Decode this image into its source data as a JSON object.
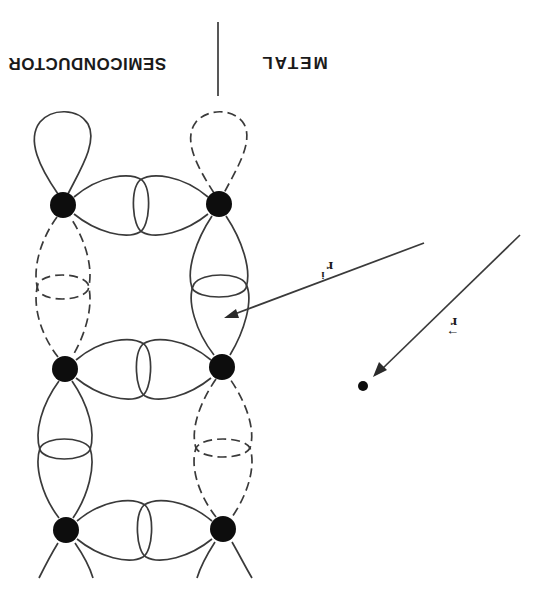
{
  "figure": {
    "orientation": "rotated 180 degrees",
    "labels": {
      "left_region": "SEMICONDUCTOR",
      "right_region": "METAL"
    },
    "vectors": [
      {
        "name": "r",
        "symbol": "r",
        "accent": "→",
        "description": "position vector pointing to a point in the metal"
      },
      {
        "name": "r_i",
        "symbol": "r",
        "subscript": "i",
        "description": "vector pointing to orbital region near interface atom"
      }
    ],
    "atoms": [
      {
        "id": "top-left",
        "x": 63,
        "y": 205
      },
      {
        "id": "top-right",
        "x": 219,
        "y": 204
      },
      {
        "id": "middle-left",
        "x": 65,
        "y": 369
      },
      {
        "id": "middle-right",
        "x": 222,
        "y": 367
      },
      {
        "id": "bottom-left",
        "x": 66,
        "y": 530
      },
      {
        "id": "bottom-right",
        "x": 223,
        "y": 529
      }
    ],
    "legend": {
      "solid_lobe": "occupied / bonding orbital",
      "dashed_lobe": "dangling / unoccupied orbital"
    },
    "colors": {
      "stroke": "#3a3a3a",
      "atom": "#0d0d0d",
      "background": "#ffffff"
    }
  }
}
